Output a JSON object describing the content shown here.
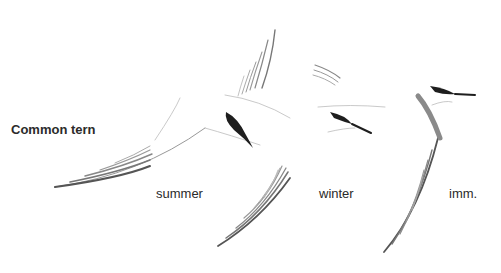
{
  "plate": {
    "title": "Common tern",
    "figures": [
      {
        "label": "summer"
      },
      {
        "label": "winter"
      },
      {
        "label": "imm."
      }
    ],
    "colors": {
      "background": "#ffffff",
      "ink": "#2a2a2a",
      "feather_grey": "#8a8a8a",
      "cap_black": "#1e1e1e"
    }
  }
}
